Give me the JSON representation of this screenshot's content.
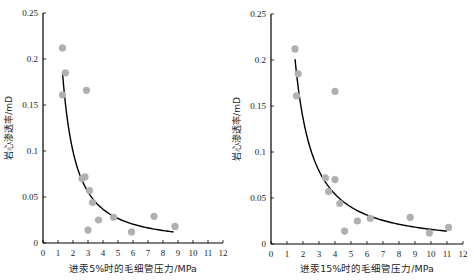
{
  "chart_data": [
    {
      "type": "scatter",
      "title": "",
      "xlabel": "进汞5%时的毛细管压力/MPa",
      "ylabel": "岩心渗透率/mD",
      "xlim": [
        0,
        12
      ],
      "ylim": [
        0,
        0.25
      ],
      "xticks": [
        "0",
        "1",
        "2",
        "3",
        "4",
        "5",
        "6",
        "7",
        "8",
        "9",
        "10",
        "11",
        "12"
      ],
      "yticks": [
        "0",
        "0.05",
        "0.1",
        "0.15",
        "0.2",
        "0.25"
      ],
      "grid": false,
      "series": [
        {
          "name": "data",
          "marker_color": "#b0b0b0",
          "x": [
            1.3,
            1.5,
            1.3,
            2.9,
            2.6,
            2.8,
            3.1,
            3.3,
            3.7,
            3.0,
            4.7,
            5.9,
            7.4,
            8.8
          ],
          "y": [
            0.212,
            0.185,
            0.161,
            0.166,
            0.07,
            0.072,
            0.057,
            0.044,
            0.025,
            0.014,
            0.028,
            0.012,
            0.029,
            0.018
          ]
        },
        {
          "name": "fit",
          "line_color": "#000000",
          "fit_type": "power",
          "x_range": [
            1.3,
            8.7
          ],
          "y_start": 0.185,
          "y_end": 0.012
        }
      ]
    },
    {
      "type": "scatter",
      "title": "",
      "xlabel": "进汞15%时的毛细管压力/MPa",
      "ylabel": "岩心渗透率/mD",
      "xlim": [
        0,
        12
      ],
      "ylim": [
        0,
        0.25
      ],
      "xticks": [
        "0",
        "1",
        "2",
        "3",
        "4",
        "5",
        "6",
        "7",
        "8",
        "9",
        "10",
        "11",
        "12"
      ],
      "yticks": [
        "0",
        "0.05",
        "0.1",
        "0.15",
        "0.2",
        "0.25"
      ],
      "grid": false,
      "series": [
        {
          "name": "data",
          "marker_color": "#b0b0b0",
          "x": [
            1.5,
            1.7,
            1.6,
            4.0,
            3.4,
            4.0,
            3.6,
            4.3,
            4.6,
            5.4,
            6.2,
            8.7,
            9.9,
            11.1
          ],
          "y": [
            0.212,
            0.185,
            0.161,
            0.166,
            0.072,
            0.07,
            0.057,
            0.044,
            0.014,
            0.025,
            0.028,
            0.029,
            0.012,
            0.018
          ]
        },
        {
          "name": "fit",
          "line_color": "#000000",
          "fit_type": "power",
          "x_range": [
            1.5,
            11.0
          ],
          "y_start": 0.201,
          "y_end": 0.014
        }
      ]
    }
  ]
}
